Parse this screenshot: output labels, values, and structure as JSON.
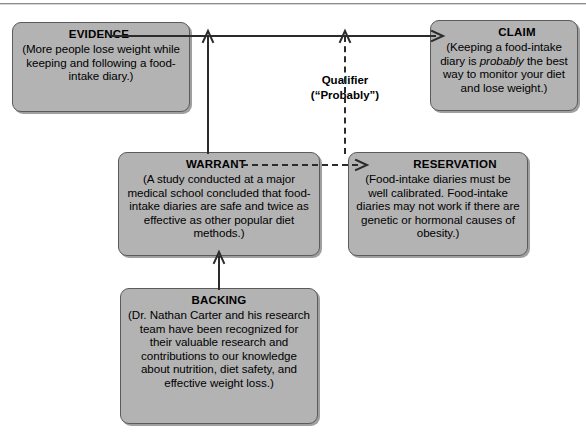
{
  "diagram": {
    "accent_color": "#b3b3b3",
    "line_color": "#2b2b2b",
    "border_color": "#5b5b5b"
  },
  "nodes": {
    "evidence": {
      "label": "EVIDENCE",
      "text": "(More people lose weight while keeping and following a food-intake diary.)"
    },
    "claim": {
      "label": "CLAIM",
      "text_before": "(Keeping a food-intake diary is ",
      "emphasis": "probably",
      "text_after": " the best way to monitor your diet and lose weight.)"
    },
    "warrant": {
      "label": "WARRANT",
      "text": "(A study conducted at a major medical school concluded that food-intake diaries are safe and twice as effective as other popular diet methods.)"
    },
    "reservation": {
      "label": "RESERVATION",
      "text": "(Food-intake diaries must be well calibrated. Food-intake diaries may not work if there are genetic or hormonal causes of obesity.)"
    },
    "backing": {
      "label": "BACKING",
      "text": "(Dr. Nathan Carter and his research team have been recognized for their valuable research and contributions to our knowledge about nutrition, diet safety, and effective weight loss.)"
    }
  },
  "qualifier": {
    "line1": "Qualifier",
    "line2": "(“Probably”)"
  },
  "connectors": {
    "evidence_to_claim": "solid-arrow-right",
    "warrant_to_claimline": "solid-arrow-up",
    "backing_to_warrant": "solid-arrow-up",
    "reservation_to_claimline": "dashed-arrow-up",
    "warrant_to_reservation": "dashed-arrow-right"
  }
}
